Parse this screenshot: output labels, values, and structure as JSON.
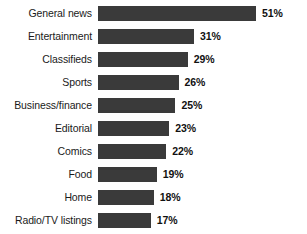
{
  "chart_data": {
    "type": "bar",
    "orientation": "horizontal",
    "title": "",
    "subtitle": "",
    "xlabel": "",
    "ylabel": "",
    "xlim": [
      0,
      51
    ],
    "grid": false,
    "legend": null,
    "value_suffix": "%",
    "categories": [
      "General news",
      "Entertainment",
      "Classifieds",
      "Sports",
      "Business/finance",
      "Editorial",
      "Comics",
      "Food",
      "Home",
      "Radio/TV listings"
    ],
    "values": [
      51,
      31,
      29,
      26,
      25,
      23,
      22,
      19,
      18,
      17
    ],
    "value_labels": [
      "51%",
      "31%",
      "29%",
      "26%",
      "25%",
      "23%",
      "22%",
      "19%",
      "18%",
      "17%"
    ],
    "colors": {
      "bar": "#3a3a3a",
      "background": "#ffffff",
      "label_text": "#1a1a1a",
      "value_text": "#111111"
    },
    "rows": [
      {
        "category": "General news",
        "value": 51,
        "value_label": "51%"
      },
      {
        "category": "Entertainment",
        "value": 31,
        "value_label": "31%"
      },
      {
        "category": "Classifieds",
        "value": 29,
        "value_label": "29%"
      },
      {
        "category": "Sports",
        "value": 26,
        "value_label": "26%"
      },
      {
        "category": "Business/finance",
        "value": 25,
        "value_label": "25%"
      },
      {
        "category": "Editorial",
        "value": 23,
        "value_label": "23%"
      },
      {
        "category": "Comics",
        "value": 22,
        "value_label": "22%"
      },
      {
        "category": "Food",
        "value": 19,
        "value_label": "19%"
      },
      {
        "category": "Home",
        "value": 18,
        "value_label": "18%"
      },
      {
        "category": "Radio/TV listings",
        "value": 17,
        "value_label": "17%"
      }
    ]
  }
}
